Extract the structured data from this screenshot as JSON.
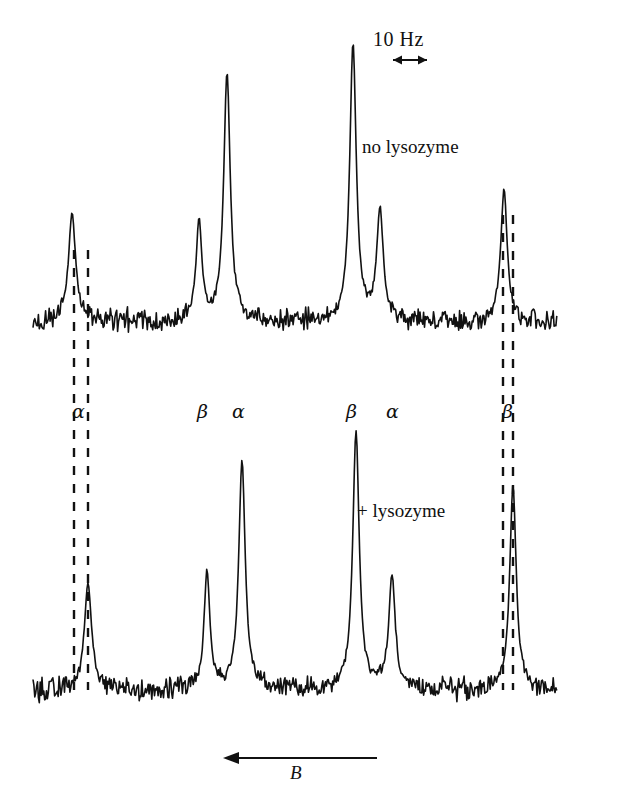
{
  "figure": {
    "kind": "nmr-spectrum-pair",
    "scale_bar": {
      "label": "10 Hz",
      "hz": 10
    },
    "field_axis": {
      "label": "B",
      "direction": "left"
    },
    "traces": [
      {
        "id": "top",
        "label": "no lysozyme"
      },
      {
        "id": "bottom",
        "label": "+ lysozyme"
      }
    ],
    "peak_labels": [
      {
        "text": "α",
        "x": 78
      },
      {
        "text": "β",
        "x": 203
      },
      {
        "text": "α",
        "x": 238
      },
      {
        "text": "β",
        "x": 352
      },
      {
        "text": "α",
        "x": 392
      },
      {
        "text": "β",
        "x": 508
      }
    ]
  },
  "chart_data": {
    "type": "line",
    "title": "",
    "xlabel": "B",
    "ylabel": "",
    "grid": false,
    "legend": "inline-annotation",
    "annotations": [
      "10 Hz",
      "no lysozyme",
      "+ lysozyme",
      "B"
    ],
    "series": [
      {
        "name": "no lysozyme",
        "baseline_y": 322,
        "noise_amplitude": 13,
        "peaks": [
          {
            "label": "α",
            "x": 72,
            "height": 108,
            "width": 9
          },
          {
            "label": "β",
            "x": 199,
            "height": 100,
            "width": 7
          },
          {
            "label": "α",
            "x": 227,
            "height": 248,
            "width": 8
          },
          {
            "label": "β",
            "x": 353,
            "height": 277,
            "width": 8
          },
          {
            "label": "α",
            "x": 380,
            "height": 110,
            "width": 8
          },
          {
            "label": "β",
            "x": 504,
            "height": 132,
            "width": 8
          }
        ]
      },
      {
        "name": "+ lysozyme",
        "baseline_y": 690,
        "noise_amplitude": 13,
        "peaks": [
          {
            "label": "α",
            "x": 88,
            "height": 106,
            "width": 9
          },
          {
            "label": "β",
            "x": 207,
            "height": 118,
            "width": 7
          },
          {
            "label": "α",
            "x": 242,
            "height": 228,
            "width": 8
          },
          {
            "label": "β",
            "x": 356,
            "height": 257,
            "width": 8
          },
          {
            "label": "α",
            "x": 392,
            "height": 113,
            "width": 8
          },
          {
            "label": "β",
            "x": 513,
            "height": 204,
            "width": 8
          }
        ]
      }
    ],
    "guide_lines": [
      {
        "x": 74,
        "y1": 250,
        "y2": 690,
        "pairs_with": "α-no-lysozyme"
      },
      {
        "x": 88,
        "y1": 250,
        "y2": 690,
        "pairs_with": "α-plus-lysozyme"
      },
      {
        "x": 503,
        "y1": 215,
        "y2": 690,
        "pairs_with": "β-no-lysozyme"
      },
      {
        "x": 513,
        "y1": 215,
        "y2": 690,
        "pairs_with": "β-plus-lysozyme"
      }
    ],
    "x_range": [
      33,
      557
    ],
    "y_range": [
      0,
      801
    ]
  }
}
